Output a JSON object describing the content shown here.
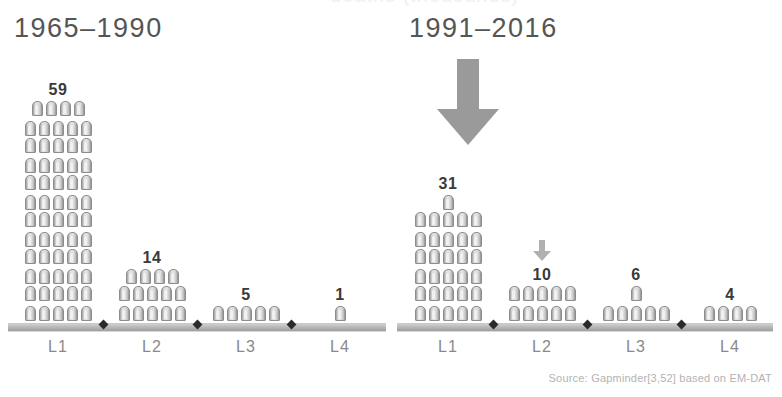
{
  "figure": {
    "cropped_top_title": "deaths (thousands)",
    "source_note": "Source: Gapminder[3,52] based on EM-DAT",
    "icon_name": "gravestone-icon",
    "colors": {
      "icon_fill": "#dedede",
      "icon_edge": "#8d8d8d",
      "arrow": "#9a9a9a",
      "ground": "#b8b8b8",
      "title_text": "#555555",
      "count_text": "#3a3a3a",
      "category_text": "#8a8a8a",
      "source_text": "#b3b3b3"
    }
  },
  "chart_data": {
    "type": "bar",
    "title": "",
    "xlabel": "",
    "ylabel": "",
    "unit_note": "each pictogram icon = 1 unit",
    "categories": [
      "L1",
      "L2",
      "L3",
      "L4"
    ],
    "series": [
      {
        "name": "1965–1990",
        "values": [
          59,
          14,
          5,
          1
        ]
      },
      {
        "name": "1991–2016",
        "values": [
          31,
          10,
          6,
          4
        ]
      }
    ],
    "annotations": [
      {
        "panel": "1991–2016",
        "target": "L1",
        "type": "down-arrow",
        "size": "large"
      },
      {
        "panel": "1991–2016",
        "target": "L2",
        "type": "down-arrow",
        "size": "small"
      }
    ],
    "grid": false,
    "legend": "none"
  },
  "panels": [
    {
      "id": "left",
      "title": "1965–1990",
      "groups": [
        {
          "label": "L1",
          "count": "59",
          "rows": [
            5,
            5,
            5,
            5,
            5,
            5,
            5,
            5,
            5,
            5,
            5,
            4
          ],
          "arrow": null
        },
        {
          "label": "L2",
          "count": "14",
          "rows": [
            5,
            5,
            4
          ],
          "arrow": null
        },
        {
          "label": "L3",
          "count": "5",
          "rows": [
            5
          ],
          "arrow": null
        },
        {
          "label": "L4",
          "count": "1",
          "rows": [
            1
          ],
          "arrow": null
        }
      ]
    },
    {
      "id": "right",
      "title": "1991–2016",
      "groups": [
        {
          "label": "L1",
          "count": "31",
          "rows": [
            5,
            5,
            5,
            5,
            5,
            5,
            1
          ],
          "arrow": "large"
        },
        {
          "label": "L2",
          "count": "10",
          "rows": [
            5,
            5
          ],
          "arrow": "small"
        },
        {
          "label": "L3",
          "count": "6",
          "rows": [
            5,
            1
          ],
          "arrow": null
        },
        {
          "label": "L4",
          "count": "4",
          "rows": [
            4
          ],
          "arrow": null
        }
      ]
    }
  ]
}
